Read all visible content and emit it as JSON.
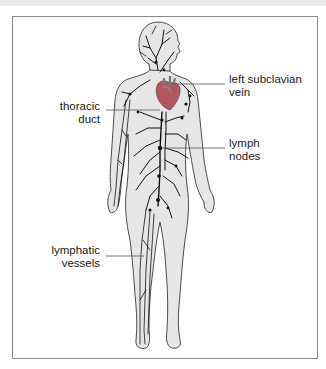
{
  "figure": {
    "colors": {
      "frame": "#8a8a8a",
      "body_fill": "#e6e6e6",
      "body_outline": "#3a3a3a",
      "vessels": "#111111",
      "heart": "#b45560",
      "leader_lines": "#555555",
      "text": "#1a1a1a"
    }
  },
  "labels": [
    {
      "id": "left-subclavian-vein",
      "lines": [
        "left subclavian",
        "vein"
      ],
      "side": "right"
    },
    {
      "id": "thoracic-duct",
      "lines": [
        "thoracic",
        "duct"
      ],
      "side": "left"
    },
    {
      "id": "lymph-nodes",
      "lines": [
        "lymph",
        "nodes"
      ],
      "side": "right"
    },
    {
      "id": "lymphatic-vessels",
      "lines": [
        "lymphatic",
        "vessels"
      ],
      "side": "left"
    }
  ]
}
